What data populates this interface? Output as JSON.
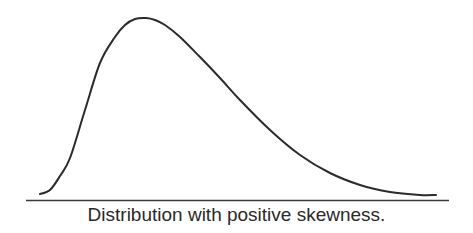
{
  "figure": {
    "caption": "Distribution with positive skewness.",
    "colors": {
      "curve": "#2b2b2b",
      "axis": "#3a3a3a",
      "background": "#ffffff",
      "text": "#2a2a2a"
    }
  },
  "chart_data": {
    "type": "line",
    "title": "Distribution with positive skewness.",
    "xlabel": "",
    "ylabel": "",
    "grid": false,
    "legend": null,
    "series": [
      {
        "name": "density",
        "points_px": [
          [
            40,
            194
          ],
          [
            50,
            190
          ],
          [
            60,
            176
          ],
          [
            70,
            158
          ],
          [
            85,
            110
          ],
          [
            100,
            63
          ],
          [
            115,
            37
          ],
          [
            125,
            25
          ],
          [
            135,
            19
          ],
          [
            146,
            18
          ],
          [
            155,
            20
          ],
          [
            165,
            25
          ],
          [
            180,
            37
          ],
          [
            200,
            57
          ],
          [
            220,
            78
          ],
          [
            240,
            100
          ],
          [
            270,
            130
          ],
          [
            300,
            155
          ],
          [
            330,
            173
          ],
          [
            360,
            185
          ],
          [
            390,
            192
          ],
          [
            420,
            195
          ],
          [
            436,
            195
          ]
        ]
      }
    ],
    "axis": {
      "x_start_px": 26,
      "x_end_px": 449,
      "y_px": 200
    }
  }
}
